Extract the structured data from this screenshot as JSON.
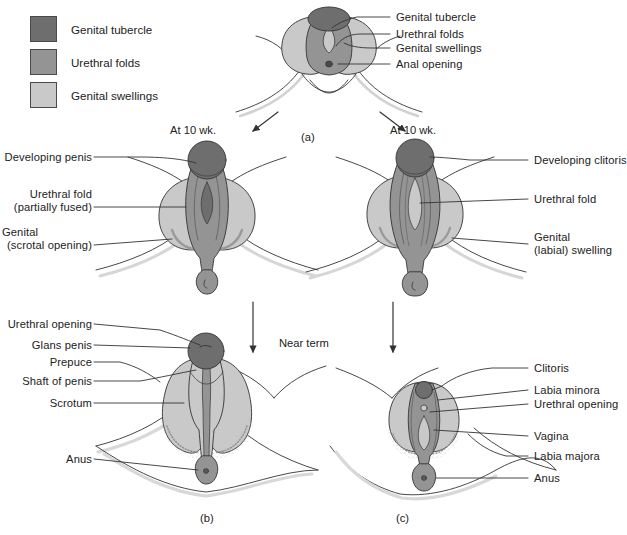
{
  "figure": {
    "legend": {
      "items": [
        {
          "label": "Genital tubercle",
          "color": "#6e6e6e",
          "swatch_name": "legend-swatch-genital-tubercle"
        },
        {
          "label": "Urethral folds",
          "color": "#949494",
          "swatch_name": "legend-swatch-urethral-folds"
        },
        {
          "label": "Genital swellings",
          "color": "#c9c9c9",
          "swatch_name": "legend-swatch-genital-swellings"
        }
      ]
    },
    "colors": {
      "genital_tubercle": "#6e6e6e",
      "urethral_folds": "#949494",
      "genital_swellings": "#c9c9c9",
      "outline": "#333333",
      "text": "#222222",
      "background": "#ffffff"
    },
    "panels": [
      {
        "id": "a",
        "caption": "(a)",
        "stage": "Indifferent stage",
        "labels": [
          "Genital tubercle",
          "Urethral folds",
          "Genital swellings",
          "Anal opening"
        ]
      },
      {
        "id": "male-10wk",
        "caption": "",
        "stage": "At 10 wk.",
        "labels": [
          "Developing penis",
          "Urethral fold\n(partially fused)",
          "Genital\n(scrotal opening)"
        ]
      },
      {
        "id": "female-10wk",
        "caption": "",
        "stage": "At 10 wk.",
        "labels": [
          "Developing clitoris",
          "Urethral fold",
          "Genital\n(labial) swelling"
        ]
      },
      {
        "id": "b",
        "caption": "(b)",
        "stage": "Near term",
        "labels": [
          "Urethral opening",
          "Glans penis",
          "Prepuce",
          "Shaft of penis",
          "Scrotum",
          "Anus"
        ]
      },
      {
        "id": "c",
        "caption": "(c)",
        "stage": "Near term",
        "labels": [
          "Clitoris",
          "Labia minora",
          "Urethral opening",
          "Vagina",
          "Labia majora",
          "Anus"
        ]
      }
    ],
    "stage_labels": {
      "at_10_wk_left": "At 10 wk.",
      "at_10_wk_right": "At 10 wk.",
      "near_term": "Near term"
    },
    "callouts": {
      "a_genital_tubercle": "Genital tubercle",
      "a_urethral_folds": "Urethral folds",
      "a_genital_swellings": "Genital swellings",
      "a_anal_opening": "Anal opening",
      "m10_developing_penis": "Developing penis",
      "m10_urethral_fold_1": "Urethral fold",
      "m10_urethral_fold_2": "(partially fused)",
      "m10_genital_1": "Genital",
      "m10_genital_2": "(scrotal opening)",
      "f10_developing_clitoris": "Developing clitoris",
      "f10_urethral_fold": "Urethral fold",
      "f10_genital_1": "Genital",
      "f10_genital_2": "(labial) swelling",
      "b_urethral_opening": "Urethral opening",
      "b_glans_penis": "Glans penis",
      "b_prepuce": "Prepuce",
      "b_shaft_of_penis": "Shaft of penis",
      "b_scrotum": "Scrotum",
      "b_anus": "Anus",
      "c_clitoris": "Clitoris",
      "c_labia_minora": "Labia minora",
      "c_urethral_opening": "Urethral opening",
      "c_vagina": "Vagina",
      "c_labia_majora": "Labia majora",
      "c_anus": "Anus"
    },
    "captions": {
      "panel_a": "(a)",
      "panel_b": "(b)",
      "panel_c": "(c)"
    }
  }
}
